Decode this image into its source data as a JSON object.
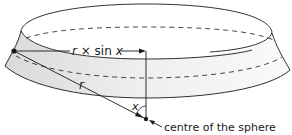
{
  "diagram": {
    "labels": {
      "horizontal_radius": "r × sin x",
      "horizontal_radius_parts": {
        "r": "r",
        "times": " × sin ",
        "x": "x"
      },
      "radius": "r",
      "angle": "x",
      "centre": "centre of the sphere"
    },
    "colors": {
      "line": "#1a1a1a",
      "band_fill": "#e2e2e2",
      "band_fill_light": "#f7f7f7",
      "background": "#ffffff"
    }
  }
}
